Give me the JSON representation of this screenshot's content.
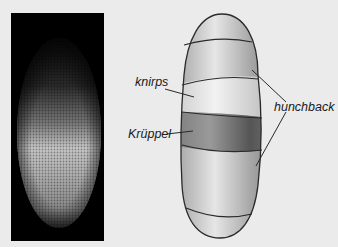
{
  "figure": {
    "left_panel": {
      "description": "fluorescence micrograph of embryo"
    },
    "labels": {
      "knirps": "knirps",
      "kruppel": "Krüppel",
      "hunchback": "hunchback"
    },
    "colors": {
      "background": "#ebebeb",
      "photo_bg": "#000000",
      "outline": "#2a2a2a",
      "band_dark": "#6e6e6e",
      "band_light": "#e2e2e2"
    }
  }
}
